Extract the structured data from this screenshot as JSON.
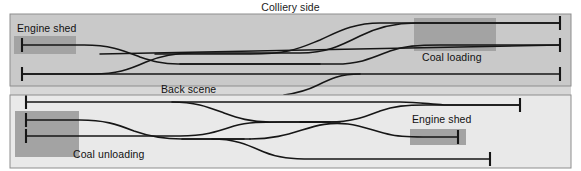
{
  "diagram": {
    "title": "Colliery side",
    "type": "model-railway-track-plan",
    "divider_label": "Back scene",
    "panels": [
      {
        "id": "upper-panel",
        "name": "colliery-side-panel",
        "background_color": "#c9c9c9",
        "labels": [
          {
            "id": "engine-shed-upper",
            "text": "Engine shed",
            "x": 18,
            "y": 26
          },
          {
            "id": "coal-loading",
            "text": "Coal loading",
            "x": 424,
            "y": 54
          }
        ],
        "buildings": [
          {
            "id": "engine-shed-building-upper",
            "name": "engine-shed-rect",
            "x": 14,
            "y": 36,
            "w": 62,
            "h": 18,
            "color": "#a3a3a3"
          },
          {
            "id": "coal-loading-building",
            "name": "coal-loading-rect",
            "x": 414,
            "y": 18,
            "w": 82,
            "h": 33,
            "color": "#a3a3a3"
          }
        ],
        "tracks": [
          {
            "id": "u-track-1",
            "role": "coal-loading-upper-siding"
          },
          {
            "id": "u-track-2",
            "role": "coal-loading-lower-siding"
          },
          {
            "id": "u-track-3",
            "role": "engine-shed-release-road"
          },
          {
            "id": "u-track-4",
            "role": "main-through-road"
          }
        ],
        "buffer_stops": [
          {
            "id": "u-bs-shed",
            "side": "left",
            "x": 21,
            "y": 45
          },
          {
            "id": "u-bs-main-left",
            "side": "left",
            "x": 21,
            "y": 74
          },
          {
            "id": "u-bs-load-top",
            "side": "right",
            "x": 562,
            "y": 23
          },
          {
            "id": "u-bs-load-bottom",
            "side": "right",
            "x": 562,
            "y": 45
          },
          {
            "id": "u-bs-main-right",
            "side": "right",
            "x": 562,
            "y": 74
          }
        ]
      },
      {
        "id": "lower-panel",
        "name": "fiddle-yard-panel",
        "background_color": "#e9e9e9",
        "labels": [
          {
            "id": "coal-unloading",
            "text": "Coal unloading",
            "x": 74,
            "y": 151
          },
          {
            "id": "engine-shed-lower",
            "text": "Engine shed",
            "x": 414,
            "y": 117
          }
        ],
        "buildings": [
          {
            "id": "coal-unloading-building",
            "name": "coal-unloading-rect",
            "x": 15,
            "y": 111,
            "w": 64,
            "h": 46,
            "color": "#a3a3a3"
          },
          {
            "id": "engine-shed-building-lower",
            "name": "engine-shed-rect",
            "x": 410,
            "y": 129,
            "w": 56,
            "h": 16,
            "color": "#a3a3a3"
          }
        ],
        "tracks": [
          {
            "id": "l-track-1",
            "role": "upper-arrival-road"
          },
          {
            "id": "l-track-2",
            "role": "coal-unloading-upper-road"
          },
          {
            "id": "l-track-3",
            "role": "coal-unloading-lower-road"
          },
          {
            "id": "l-track-4",
            "role": "engine-shed-spur"
          },
          {
            "id": "l-track-5",
            "role": "lower-loop-road"
          }
        ],
        "buffer_stops": [
          {
            "id": "l-bs-top-left",
            "side": "left",
            "x": 25,
            "y": 102
          },
          {
            "id": "l-bs-unload-top",
            "side": "left",
            "x": 25,
            "y": 120
          },
          {
            "id": "l-bs-unload-bottom",
            "side": "left",
            "x": 25,
            "y": 136
          },
          {
            "id": "l-bs-top-right",
            "side": "right",
            "x": 522,
            "y": 102
          },
          {
            "id": "l-bs-shed-right",
            "side": "right",
            "x": 459,
            "y": 137
          },
          {
            "id": "l-bs-bottom-right",
            "side": "right",
            "x": 491,
            "y": 159
          }
        ]
      }
    ],
    "colors": {
      "track": "#161616",
      "border": "#8d8d8d",
      "upper_bg": "#c9c9c9",
      "lower_bg": "#e9e9e9",
      "divider_bg": "#d7d7d7",
      "building": "#a3a3a3",
      "text": "#111111"
    }
  }
}
